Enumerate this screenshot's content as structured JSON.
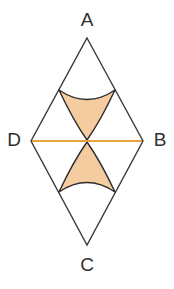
{
  "figure": {
    "background_color": "#ffffff",
    "canvas": {
      "width": 174,
      "height": 289
    },
    "stroke_color": "#3a3a3a",
    "stroke_width": 1.4,
    "diagonal_color": "#e8a33d",
    "diagonal_width": 2.2,
    "shade_fill": "#f5cba0",
    "shade_stroke": "#2b2b2b",
    "shade_stroke_width": 1.4,
    "label_color": "#2f2f2f",
    "label_font_size": 19,
    "vertices": [
      {
        "name": "A",
        "label": "A",
        "x": 87,
        "y": 38,
        "label_x": 87,
        "label_y": 21
      },
      {
        "name": "B",
        "label": "B",
        "x": 143,
        "y": 141,
        "label_x": 160,
        "label_y": 141
      },
      {
        "name": "C",
        "label": "C",
        "x": 87,
        "y": 245,
        "label_x": 87,
        "label_y": 266
      },
      {
        "name": "D",
        "label": "D",
        "x": 31,
        "y": 141,
        "label_x": 14,
        "label_y": 141
      }
    ],
    "rhombus_path": "M 87 38 L 143 141 L 87 245 L 31 141 Z",
    "diagonal": {
      "name": "DB",
      "x1": 32,
      "y1": 141,
      "x2": 142,
      "y2": 141
    },
    "shaded_regions": [
      {
        "name": "upper-curvilinear-triangle",
        "path": "M 59 90 Q 87 109 115 90 Q 101 120 87 140 Q 73 120 59 90 Z"
      },
      {
        "name": "lower-curvilinear-triangle",
        "path": "M 59 192 Q 87 173 115 192 Q 101 162 87 142 Q 73 162 59 192 Z"
      }
    ]
  }
}
